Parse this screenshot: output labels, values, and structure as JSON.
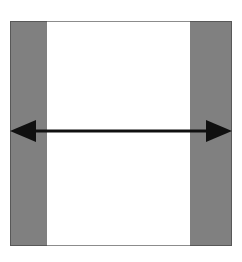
{
  "figure": {
    "background_color": "#ffffff",
    "canvas": {
      "width": 242,
      "height": 262
    }
  },
  "frame": {
    "x": 10,
    "y": 21,
    "width": 222,
    "height": 225,
    "fill_color": "#ffffff",
    "edge_rule_color": "#8c8c8c"
  },
  "bars": [
    {
      "name": "left-gray-bar",
      "label": "",
      "x": 10,
      "y": 21,
      "width": 37,
      "height": 225,
      "fill_color": "#808080",
      "stroke_color": "#585858"
    },
    {
      "name": "right-gray-bar",
      "label": "",
      "x": 190,
      "y": 21,
      "width": 42,
      "height": 225,
      "fill_color": "#808080",
      "stroke_color": "#585858"
    }
  ],
  "center_panel": {
    "name": "white-center-panel",
    "label": "",
    "x": 47,
    "y": 21,
    "width": 143,
    "height": 225,
    "fill_color": "#ffffff"
  },
  "arrow": {
    "label": "",
    "color": "#101010",
    "y": 131,
    "shaft_thickness": 3,
    "left_tip_x": 10,
    "right_tip_x": 232,
    "head_length": 26,
    "head_half_height": 11,
    "direction": "double"
  }
}
